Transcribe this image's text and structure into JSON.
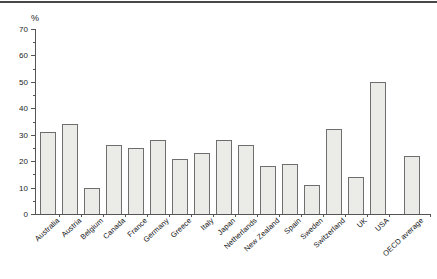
{
  "page": {
    "background": "#ffffff",
    "top_rule_color": "#474747"
  },
  "chart_data": {
    "type": "bar",
    "title": "",
    "xlabel": "",
    "ylabel": "%",
    "categories": [
      "Australia",
      "Austria",
      "Belgium",
      "Canada",
      "France",
      "Germany",
      "Greece",
      "Italy",
      "Japan",
      "Netherlands",
      "New Zealand",
      "Spain",
      "Sweden",
      "Switzerland",
      "UK",
      "USA",
      "OECD average"
    ],
    "values": [
      31,
      34,
      10,
      26,
      25,
      28,
      21,
      23,
      28,
      26,
      18,
      19,
      11,
      32,
      14,
      50,
      22
    ],
    "ylim": [
      0,
      70
    ],
    "yticks": [
      0,
      10,
      20,
      30,
      40,
      50,
      60,
      70
    ],
    "ytick_minor_step": 5,
    "grid": false,
    "legend": null,
    "separated_last_category": true,
    "bar_color": "#ebebe8",
    "bar_border_color": "#6e6e6e",
    "axis_color": "#555555",
    "label_rotation_deg": -43
  }
}
